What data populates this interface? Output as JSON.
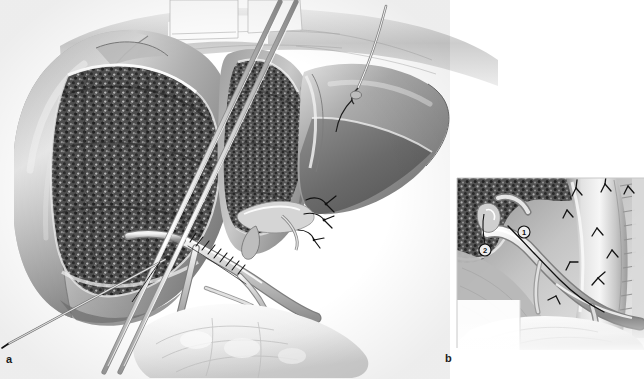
{
  "figure": {
    "type": "medical-illustration",
    "style": "grayscale pen-and-ink surgical drawing",
    "background_color": "#ffffff",
    "width": 644,
    "height": 379,
    "panels": [
      {
        "id": "a",
        "label": "a",
        "label_position": {
          "x": 6,
          "y": 354
        },
        "bounds": {
          "x": 0,
          "y": 0,
          "width": 450,
          "height": 379
        },
        "description": "Operative view of the liver after transection, showing the cut parenchymal surface, retracted left lobe, hilar vascular structures with sutures, surgical retractors and instruments."
      },
      {
        "id": "b",
        "label": "b",
        "label_position": {
          "x": 445,
          "y": 353
        },
        "bounds": {
          "x": 457,
          "y": 178,
          "width": 187,
          "height": 172
        },
        "description": "Magnified inset of the hepatic hilum showing the anastomosis with two circled reference numbers and interrupted sutures along the tubular conduit."
      }
    ],
    "callouts": [
      {
        "id": "1",
        "symbol": "①",
        "text": "1",
        "panel": "b",
        "x": 524,
        "y": 232
      },
      {
        "id": "2",
        "symbol": "②",
        "text": "2",
        "panel": "b",
        "x": 485,
        "y": 250
      }
    ],
    "anatomy": [
      {
        "name": "left-liver-lobe",
        "panel": "a",
        "tone": "#9a9a9a"
      },
      {
        "name": "cut-parenchymal-surface",
        "panel": "a",
        "tone": "#4a4a4a",
        "texture": "granular-stippled"
      },
      {
        "name": "right-liver-lobe",
        "panel": "a",
        "tone": "#8d8d8d"
      },
      {
        "name": "caudate-segment",
        "panel": "a",
        "tone": "#858585"
      },
      {
        "name": "hepatic-hilum-vessels",
        "panel": "a",
        "tone": "#b4b4b4"
      },
      {
        "name": "portal-vein-branch",
        "panel": "a",
        "tone": "#c2c2c2"
      },
      {
        "name": "bile-duct-stump",
        "panel": "a",
        "tone": "#d0d0d0"
      },
      {
        "name": "duodenum-bowel",
        "panel": "a",
        "tone": "#e4e4e4"
      },
      {
        "name": "diaphragm-abdominal-wall",
        "panel": "a",
        "tone": "#cfcfcf"
      }
    ],
    "instruments": [
      {
        "name": "retractor-blade-left",
        "panel": "a",
        "x": 168,
        "y": 0
      },
      {
        "name": "retractor-blade-right",
        "panel": "a",
        "x": 236,
        "y": 0
      },
      {
        "name": "suction-probe-shaft",
        "panel": "a",
        "description": "long double-line metal shaft crossing from upper-centre to lower-left"
      },
      {
        "name": "needle-holder-needle",
        "panel": "a",
        "description": "curved needle with suture entering the right lobe"
      },
      {
        "name": "traction-needle-lower-left",
        "panel": "a",
        "description": "fine straight needle at the inferior left liver edge"
      }
    ],
    "sutures": [
      {
        "name": "running-suture-hilum",
        "panel": "a",
        "count": 9
      },
      {
        "name": "knot-tails-vascular-stump",
        "panel": "a",
        "count": 4
      },
      {
        "name": "interrupted-sutures-conduit",
        "panel": "b",
        "count": 8
      }
    ],
    "palette": {
      "ink": "#111111",
      "mid_gray": "#9a9a9a",
      "dark_gray": "#4a4a4a",
      "light_gray": "#d8d8d8",
      "highlight": "#ffffff"
    }
  }
}
